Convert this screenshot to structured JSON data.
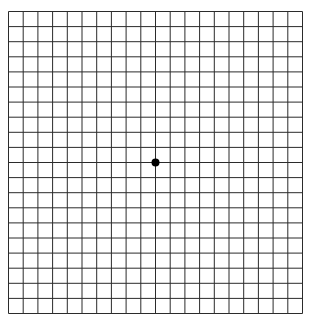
{
  "diagram": {
    "type": "amsler-grid",
    "columns": 20,
    "rows": 20,
    "grid": {
      "left": 8.5,
      "top": 11.5,
      "right": 302.5,
      "bottom": 313.5
    },
    "line_color": "#2b2b2b",
    "background": "#ffffff",
    "center_dot": {
      "x": 155.5,
      "y": 162.5,
      "radius": 4,
      "color": "#000000"
    }
  }
}
